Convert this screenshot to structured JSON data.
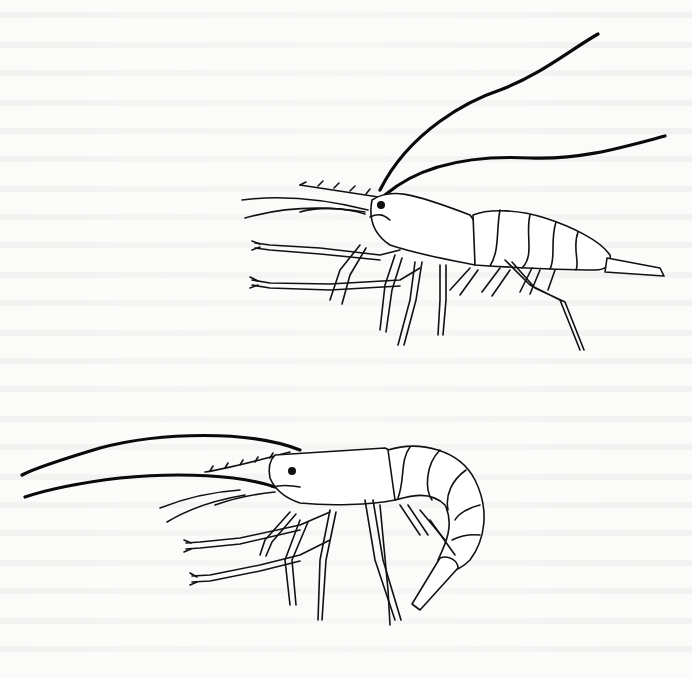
{
  "figure": {
    "illustrations": [
      {
        "name": "upper-shrimp",
        "pose": "extended",
        "facing": "left"
      },
      {
        "name": "lower-shrimp",
        "pose": "curled",
        "facing": "left"
      }
    ],
    "colors": {
      "ink": "#111111",
      "paper": "#fbfbfa"
    }
  }
}
